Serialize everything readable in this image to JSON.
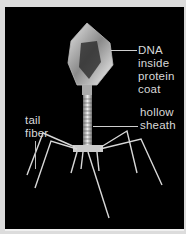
{
  "figure": {
    "labels": {
      "dna": [
        "DNA",
        "inside",
        "protein",
        "coat"
      ],
      "sheath": [
        "hollow",
        "sheath"
      ],
      "tail_fiber": [
        "tail",
        "fiber"
      ]
    }
  }
}
